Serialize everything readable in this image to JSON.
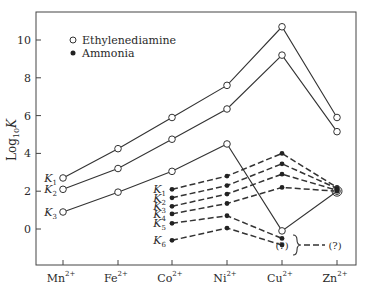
{
  "chart_data": {
    "type": "line",
    "title": "",
    "xlabel": "",
    "ylabel": "Log10 K",
    "ylabel_main": "Log",
    "ylabel_sub": "10",
    "ylabel_var": "K",
    "ylim": [
      -2,
      11
    ],
    "yticks": [
      0,
      2,
      4,
      6,
      8,
      10
    ],
    "grid": false,
    "legend_position": "top-left",
    "categories": [
      "Mn",
      "Fe",
      "Co",
      "Ni",
      "Cu",
      "Zn"
    ],
    "category_charge": "2+",
    "legend": [
      {
        "name": "Ethylenediamine",
        "marker": "open-circle"
      },
      {
        "name": "Ammonia",
        "marker": "filled-circle"
      }
    ],
    "series": [
      {
        "group": "Ethylenediamine",
        "name": "K1",
        "label": "K",
        "sub": "1",
        "style": "solid",
        "marker": "open",
        "values": [
          2.7,
          4.25,
          5.9,
          7.6,
          10.7,
          5.9
        ]
      },
      {
        "group": "Ethylenediamine",
        "name": "K2",
        "label": "K",
        "sub": "2",
        "style": "solid",
        "marker": "open",
        "values": [
          2.1,
          3.2,
          4.75,
          6.35,
          9.2,
          5.15
        ]
      },
      {
        "group": "Ethylenediamine",
        "name": "K3",
        "label": "K",
        "sub": "3",
        "style": "solid",
        "marker": "open",
        "values": [
          0.9,
          1.95,
          3.05,
          4.5,
          -0.1,
          2.0
        ]
      },
      {
        "group": "Ammonia",
        "name": "K1",
        "label": "K",
        "sub": "1",
        "style": "dashed",
        "marker": "filled",
        "values": [
          null,
          null,
          2.1,
          2.8,
          4.0,
          2.2
        ]
      },
      {
        "group": "Ammonia",
        "name": "K2",
        "label": "K",
        "sub": "2",
        "style": "dashed",
        "marker": "filled",
        "values": [
          null,
          null,
          1.65,
          2.3,
          3.45,
          2.15
        ]
      },
      {
        "group": "Ammonia",
        "name": "K3",
        "label": "K",
        "sub": "3",
        "style": "dashed",
        "marker": "filled",
        "values": [
          null,
          null,
          1.2,
          1.85,
          2.9,
          2.05
        ]
      },
      {
        "group": "Ammonia",
        "name": "K4",
        "label": "K",
        "sub": "4",
        "style": "dashed",
        "marker": "filled",
        "values": [
          null,
          null,
          0.8,
          1.35,
          2.2,
          2.0
        ]
      },
      {
        "group": "Ammonia",
        "name": "K5",
        "label": "K",
        "sub": "5",
        "style": "dashed",
        "marker": "filled",
        "values": [
          null,
          null,
          0.3,
          0.7,
          -0.5,
          null
        ]
      },
      {
        "group": "Ammonia",
        "name": "K6",
        "label": "K",
        "sub": "6",
        "style": "dashed",
        "marker": "filled",
        "values": [
          null,
          null,
          -0.6,
          0.05,
          -0.85,
          null
        ]
      }
    ],
    "annotations": [
      {
        "text": "(?)",
        "category": "Cu",
        "y": -0.85
      },
      {
        "text": "(?)",
        "category": "Zn",
        "y": -0.85
      }
    ]
  }
}
